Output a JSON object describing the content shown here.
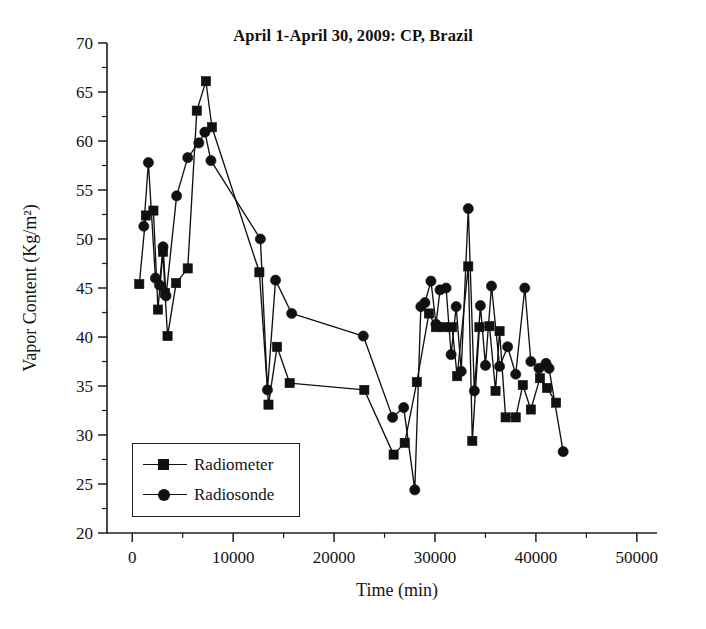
{
  "chart_data": {
    "type": "line",
    "title": "April 1-April 30, 2009: CP, Brazil",
    "xlabel": "Time (min)",
    "ylabel": "Vapor Content (Kg/m²)",
    "xlim": [
      -2500,
      52000
    ],
    "ylim": [
      20,
      70
    ],
    "xticks": [
      0,
      10000,
      20000,
      30000,
      40000,
      50000
    ],
    "xtick_labels": [
      "0",
      "10000",
      "20000",
      "30000",
      "40000",
      "50000"
    ],
    "yticks": [
      20,
      25,
      30,
      35,
      40,
      45,
      50,
      55,
      60,
      65,
      70
    ],
    "ytick_labels": [
      "20",
      "25",
      "30",
      "35",
      "40",
      "45",
      "50",
      "55",
      "60",
      "65",
      "70"
    ],
    "x_minor_step": 5000,
    "y_minor_step": 2.5,
    "grid": false,
    "legend_position": "lower-left",
    "series": [
      {
        "name": "Radiometer",
        "marker": "square",
        "color": "#111111",
        "points": [
          [
            700,
            45.4
          ],
          [
            1350,
            52.4
          ],
          [
            2100,
            52.9
          ],
          [
            2550,
            42.8
          ],
          [
            3050,
            48.7
          ],
          [
            3250,
            44.5
          ],
          [
            3500,
            40.1
          ],
          [
            4350,
            45.5
          ],
          [
            5500,
            47.0
          ],
          [
            6400,
            63.1
          ],
          [
            7300,
            66.1
          ],
          [
            7900,
            61.4
          ],
          [
            12600,
            46.6
          ],
          [
            13500,
            33.1
          ],
          [
            14350,
            39.0
          ],
          [
            15600,
            35.3
          ],
          [
            23000,
            34.6
          ],
          [
            25900,
            28.0
          ],
          [
            27000,
            29.2
          ],
          [
            28200,
            35.4
          ],
          [
            29400,
            42.4
          ],
          [
            30100,
            41.0
          ],
          [
            30900,
            41.0
          ],
          [
            31700,
            41.0
          ],
          [
            32200,
            36.0
          ],
          [
            33300,
            47.2
          ],
          [
            33700,
            29.4
          ],
          [
            34400,
            41.0
          ],
          [
            35400,
            41.1
          ],
          [
            36000,
            34.5
          ],
          [
            36400,
            40.6
          ],
          [
            37000,
            31.8
          ],
          [
            38000,
            31.8
          ],
          [
            38700,
            35.1
          ],
          [
            39500,
            32.6
          ],
          [
            40400,
            35.8
          ],
          [
            41100,
            34.8
          ],
          [
            42000,
            33.3
          ]
        ]
      },
      {
        "name": "Radiosonde",
        "marker": "circle",
        "color": "#111111",
        "points": [
          [
            1150,
            51.3
          ],
          [
            1600,
            57.8
          ],
          [
            2300,
            46.0
          ],
          [
            2700,
            45.3
          ],
          [
            3050,
            49.2
          ],
          [
            3350,
            44.2
          ],
          [
            4400,
            54.4
          ],
          [
            5500,
            58.3
          ],
          [
            6600,
            59.8
          ],
          [
            7200,
            60.9
          ],
          [
            7800,
            58.0
          ],
          [
            12700,
            50.0
          ],
          [
            13400,
            34.6
          ],
          [
            14200,
            45.8
          ],
          [
            15800,
            42.4
          ],
          [
            22900,
            40.1
          ],
          [
            25800,
            31.8
          ],
          [
            26900,
            32.8
          ],
          [
            28000,
            24.4
          ],
          [
            28600,
            43.1
          ],
          [
            29000,
            43.5
          ],
          [
            29600,
            45.7
          ],
          [
            30100,
            41.3
          ],
          [
            30500,
            44.8
          ],
          [
            31100,
            45.0
          ],
          [
            31600,
            38.2
          ],
          [
            32100,
            43.1
          ],
          [
            32600,
            36.5
          ],
          [
            33300,
            53.1
          ],
          [
            33900,
            34.5
          ],
          [
            34500,
            43.2
          ],
          [
            35000,
            37.1
          ],
          [
            35600,
            45.2
          ],
          [
            36400,
            37.0
          ],
          [
            37200,
            39.0
          ],
          [
            38000,
            36.2
          ],
          [
            38900,
            45.0
          ],
          [
            39500,
            37.5
          ],
          [
            40300,
            36.8
          ],
          [
            41000,
            37.3
          ],
          [
            41300,
            36.8
          ],
          [
            42700,
            28.3
          ]
        ]
      }
    ]
  },
  "axes": {
    "ylabel_text": "Vapor Content (Kg/m²)",
    "xlabel_text": "Time (min)"
  },
  "legend": {
    "entries": [
      {
        "label": "Radiometer",
        "marker": "square"
      },
      {
        "label": "Radiosonde",
        "marker": "circle"
      }
    ]
  }
}
